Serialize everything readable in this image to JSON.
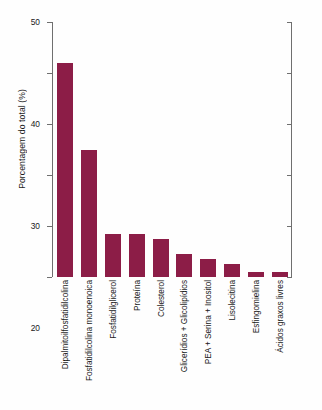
{
  "chart_data": {
    "type": "bar",
    "title": "",
    "subtitle": "",
    "xlabel": "",
    "ylabel": "Porcentagem do total (%)",
    "ylim": [
      0,
      50
    ],
    "yticks": [
      0,
      10,
      20,
      30,
      40,
      50
    ],
    "ytick_labels": [
      "0",
      "10",
      "20",
      "30",
      "40",
      "50"
    ],
    "grid": false,
    "legend": null,
    "bar_color": "#8c1d47",
    "axis_color": "#6f6f6f",
    "background_color": "#fefefe",
    "categories": [
      "Dipalmitoilfosfatidilcolina",
      "Fosfatidilcolina monoenoica",
      "Fosfatidilglicerol",
      "Proteína",
      "Colesterol",
      "Glicerídios + Glicolipídios",
      "PEA + Serina + Inositol",
      "Lisolecitina",
      "Esfingomielina",
      "Ácidos graxos livres"
    ],
    "values": [
      42,
      25,
      8.5,
      8.5,
      7.5,
      4.5,
      3.5,
      2.5,
      1,
      1
    ]
  }
}
